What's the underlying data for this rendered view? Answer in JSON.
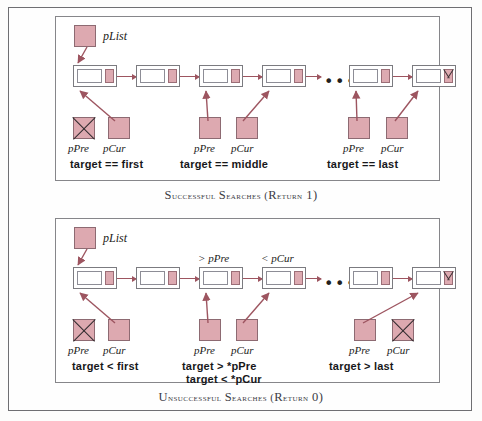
{
  "figure": {
    "pink": "#dda9b0",
    "arrow_color": "#9d5560"
  },
  "panels": [
    {
      "id": "successful",
      "caption_first_letters": "S",
      "caption": "uccessful ",
      "caption_full": "SUCCESSFUL SEARCHES (RETURN 1)",
      "caption_parts": {
        "w1_first": "S",
        "w1_rest": "UCCESSFUL",
        "w2_first": "S",
        "w2_rest": "EARCHES",
        "paren_open": "(",
        "w3_first": "R",
        "w3_rest": "ETURN",
        "num": " 1",
        "paren_close": ")"
      },
      "head_pointer_label": "pList",
      "nodes": [
        {
          "index": 0,
          "null_link": false
        },
        {
          "index": 1,
          "null_link": false
        },
        {
          "index": 2,
          "null_link": false
        },
        {
          "index": 3,
          "null_link": false
        },
        {
          "index": 4,
          "null_link": false
        },
        {
          "index": 5,
          "null_link": true
        }
      ],
      "ellipsis": "•••",
      "node_top_labels": [],
      "cases": [
        {
          "caption": "target ==  first",
          "pre_label": "pPre",
          "cur_label": "pCur",
          "pre_null": true,
          "cur_null": false
        },
        {
          "caption": "target ==  middle",
          "pre_label": "pPre",
          "cur_label": "pCur",
          "pre_null": false,
          "cur_null": false
        },
        {
          "caption": "target == last",
          "pre_label": "pPre",
          "cur_label": "pCur",
          "pre_null": false,
          "cur_null": false
        }
      ]
    },
    {
      "id": "unsuccessful",
      "caption_full": "UNSUCCESSFUL SEARCHES (RETURN 0)",
      "caption_parts": {
        "w1_first": "U",
        "w1_rest": "NSUCCESSFUL",
        "w2_first": "S",
        "w2_rest": "EARCHES",
        "paren_open": "(",
        "w3_first": "R",
        "w3_rest": "ETURN",
        "num": " 0",
        "paren_close": ")"
      },
      "head_pointer_label": "pList",
      "nodes": [
        {
          "index": 0,
          "null_link": false
        },
        {
          "index": 1,
          "null_link": false
        },
        {
          "index": 2,
          "null_link": false
        },
        {
          "index": 3,
          "null_link": false
        },
        {
          "index": 4,
          "null_link": false
        },
        {
          "index": 5,
          "null_link": true
        }
      ],
      "ellipsis": "•••",
      "node_top_labels": [
        {
          "text": "> pPre"
        },
        {
          "text": "< pCur"
        }
      ],
      "cases": [
        {
          "caption": "target < first",
          "caption2": "",
          "pre_label": "pPre",
          "cur_label": "pCur",
          "pre_null": true,
          "cur_null": false
        },
        {
          "caption": "target  >  *pPre",
          "caption2": "target  <  *pCur",
          "pre_label": "pPre",
          "cur_label": "pCur",
          "pre_null": false,
          "cur_null": false
        },
        {
          "caption": "target  >  last",
          "caption2": "",
          "pre_label": "pPre",
          "cur_label": "pCur",
          "pre_null": false,
          "cur_null": true
        }
      ]
    }
  ]
}
